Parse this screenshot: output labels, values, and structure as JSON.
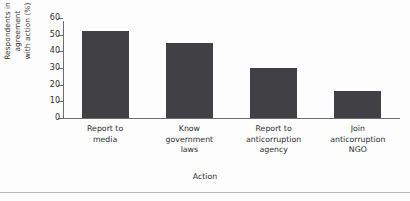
{
  "chart_data": {
    "type": "bar",
    "title": "",
    "subtitle": "",
    "xlabel": "Action",
    "ylabel": "Respondents in agreement with action (%)",
    "ylabel_lines": [
      "Respondents in",
      "agreement",
      "with action (%)"
    ],
    "categories": [
      "Report to\nmedia",
      "Know\ngovernment\nlaws",
      "Report to\nanticorruption\nagency",
      "Join\nanticorruption\nNGO"
    ],
    "values": [
      52,
      45,
      30,
      16
    ],
    "ylim": [
      0,
      60
    ],
    "yticks": [
      0,
      10,
      20,
      30,
      40,
      50,
      60
    ],
    "ytick_labels": [
      "0",
      "10",
      "20",
      "30",
      "40",
      "50",
      "60"
    ],
    "grid": false,
    "legend": false,
    "bar_color": "#414145",
    "axis_color": "#6d6d70",
    "background_color": "#fdfdfd"
  }
}
